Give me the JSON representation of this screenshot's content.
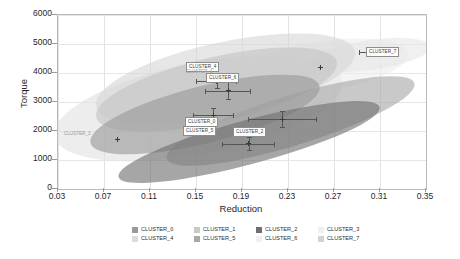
{
  "chart_data": {
    "type": "scatter",
    "title": "",
    "xlabel": "Reduction",
    "ylabel": "Torque",
    "xlim": [
      0.03,
      0.35
    ],
    "ylim": [
      0,
      6000
    ],
    "xticks": [
      "0.03",
      "0.07",
      "0.11",
      "0.15",
      "0.19",
      "0.23",
      "0.27",
      "0.31",
      "0.35"
    ],
    "xtick_values": [
      0.03,
      0.07,
      0.11,
      0.15,
      0.19,
      0.23,
      0.27,
      0.31,
      0.35
    ],
    "yticks": [
      "0",
      "1000",
      "2000",
      "3000",
      "4000",
      "5000",
      "6000"
    ],
    "ytick_values": [
      0,
      1000,
      2000,
      3000,
      4000,
      5000,
      6000
    ],
    "grid": true,
    "legend_position": "bottom",
    "series": [
      {
        "name": "CLUSTER_0",
        "color": "#9a9a9a",
        "centroid": {
          "x": 0.165,
          "y": 2550
        },
        "xerr": 0.018,
        "yerr": 260,
        "ellipse": {
          "cx": 0.158,
          "cy": 2560,
          "width": 0.205,
          "height": 1950,
          "angle": -14
        },
        "label": "CLUSTER_0"
      },
      {
        "name": "CLUSTER_1",
        "color": "#c4c4c4",
        "centroid": {
          "x": 0.178,
          "y": 3380
        },
        "xerr": 0.02,
        "yerr": 300,
        "ellipse": {
          "cx": 0.168,
          "cy": 3430,
          "width": 0.215,
          "height": 2250,
          "angle": -13
        },
        "label": "CLUSTER_1"
      },
      {
        "name": "CLUSTER_2",
        "color": "#6f6f6f",
        "centroid": {
          "x": 0.196,
          "y": 1560
        },
        "xerr": 0.023,
        "yerr": 250,
        "ellipse": {
          "cx": 0.196,
          "cy": 1620,
          "width": 0.235,
          "height": 1500,
          "angle": -15
        },
        "label": "CLUSTER_2"
      },
      {
        "name": "CLUSTER_3",
        "color": "#e2e2e2",
        "centroid": {
          "x": 0.082,
          "y": 1720
        },
        "xerr": 0.0,
        "yerr": 0,
        "ellipse": {
          "cx": 0.152,
          "cy": 2760,
          "width": 0.255,
          "height": 3150,
          "angle": -11
        },
        "label": "CLUSTER_3"
      },
      {
        "name": "CLUSTER_4",
        "color": "#d6d6d6",
        "centroid": {
          "x": 0.168,
          "y": 3720
        },
        "xerr": 0.018,
        "yerr": 280,
        "ellipse": {
          "cx": 0.175,
          "cy": 3780,
          "width": 0.23,
          "height": 2550,
          "angle": -12
        },
        "label": "CLUSTER_4"
      },
      {
        "name": "CLUSTER_5",
        "color": "#a8a8a8",
        "centroid": {
          "x": 0.225,
          "y": 2400
        },
        "xerr": 0.03,
        "yerr": 300,
        "ellipse": {
          "cx": 0.232,
          "cy": 2330,
          "width": 0.225,
          "height": 1720,
          "angle": -17
        },
        "label": "CLUSTER_5"
      },
      {
        "name": "CLUSTER_6",
        "color": "#ededed",
        "centroid": {
          "x": 0.258,
          "y": 4180
        },
        "xerr": 0.0,
        "yerr": 0,
        "ellipse": {
          "cx": 0.258,
          "cy": 4200,
          "width": 0.155,
          "height": 1720,
          "angle": -9
        },
        "label": "CLUSTER_6"
      },
      {
        "name": "CLUSTER_7",
        "color": "#e7e7e7",
        "centroid": {
          "x": 0.308,
          "y": 4720
        },
        "xerr": 0.016,
        "yerr": 180,
        "ellipse": {
          "cx": 0.302,
          "cy": 4620,
          "width": 0.105,
          "height": 1020,
          "angle": -8
        },
        "label": "CLUSTER_7"
      }
    ],
    "annotations": [
      {
        "text": "CLUSTER_4",
        "x": 186,
        "y": 62,
        "boxed": true
      },
      {
        "text": "CLUSTER_1",
        "x": 186,
        "y": 69,
        "boxed": false
      },
      {
        "text": "CLUSTER_6",
        "x": 206,
        "y": 73,
        "boxed": true
      },
      {
        "text": "CLUSTER_7",
        "x": 366,
        "y": 47,
        "boxed": true
      },
      {
        "text": "CLUSTER_0",
        "x": 185,
        "y": 117,
        "boxed": true
      },
      {
        "text": "CLUSTER_5",
        "x": 183,
        "y": 126,
        "boxed": true
      },
      {
        "text": "CLUSTER_2",
        "x": 233,
        "y": 127,
        "boxed": true
      },
      {
        "text": "CLUSTER_3",
        "x": 64,
        "y": 131,
        "boxed": false
      }
    ]
  },
  "legend": {
    "rows": [
      [
        {
          "label": "CLUSTER_0",
          "color": "#9a9a9a"
        },
        {
          "label": "CLUSTER_1",
          "color": "#c9c9c9"
        },
        {
          "label": "CLUSTER_2",
          "color": "#6f6f6f"
        },
        {
          "label": "CLUSTER_3",
          "color": "#efefef"
        }
      ],
      [
        {
          "label": "CLUSTER_4",
          "color": "#dcdcdc"
        },
        {
          "label": "CLUSTER_5",
          "color": "#a8a8a8"
        },
        {
          "label": "CLUSTER_6",
          "color": "#f0f0f0"
        },
        {
          "label": "CLUSTER_7",
          "color": "#d2d2d2"
        }
      ]
    ]
  }
}
